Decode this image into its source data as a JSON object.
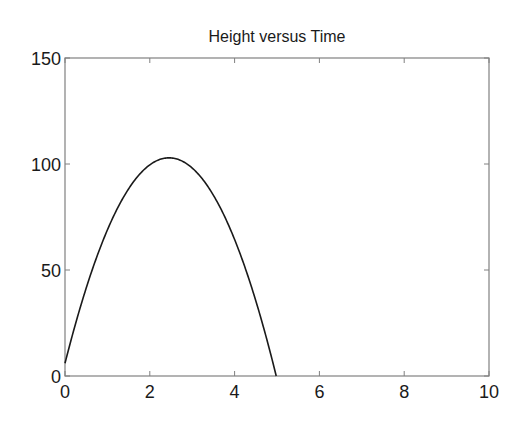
{
  "chart_data": {
    "type": "line",
    "title": "Height versus Time",
    "xlabel": "",
    "ylabel": "",
    "xlim": [
      0,
      10
    ],
    "ylim": [
      0,
      150
    ],
    "x_ticks": [
      0,
      2,
      4,
      6,
      8,
      10
    ],
    "y_ticks": [
      0,
      50,
      100,
      150
    ],
    "x_tick_labels": [
      "0",
      "2",
      "4",
      "6",
      "8",
      "10"
    ],
    "y_tick_labels": [
      "0",
      "50",
      "100",
      "150"
    ],
    "grid": false,
    "legend": null,
    "series": [
      {
        "name": "height",
        "color": "#1a1a1a",
        "model": "h(t) = 6 + 79 t - 16.1 t^2",
        "x": [
          0,
          0.25,
          0.5,
          0.75,
          1.0,
          1.25,
          1.5,
          1.75,
          2.0,
          2.25,
          2.45,
          2.5,
          2.75,
          3.0,
          3.25,
          3.5,
          3.75,
          4.0,
          4.25,
          4.5,
          4.75,
          5.0
        ],
        "y": [
          6.0,
          24.7,
          41.5,
          56.2,
          68.9,
          79.6,
          88.3,
          94.9,
          99.6,
          102.3,
          103.0,
          103.0,
          102.0,
          98.1,
          92.7,
          79.8,
          75.8,
          66.4,
          51.8,
          35.4,
          20.2,
          0.5
        ]
      }
    ]
  },
  "plot": {
    "title": "Height versus Time",
    "axis_color": "#808080",
    "line_color": "#1a1a1a"
  }
}
